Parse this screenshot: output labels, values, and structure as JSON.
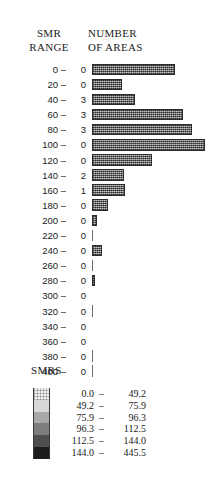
{
  "header": {
    "smr_range_line1": "SMR",
    "smr_range_line2": "RANGE",
    "number_areas_line1": "NUMBER",
    "number_areas_line2": "OF AREAS"
  },
  "chart_data": {
    "type": "bar",
    "orientation": "horizontal",
    "title": "",
    "xlabel": "NUMBER OF AREAS",
    "ylabel": "SMR RANGE",
    "grid": false,
    "legend_position": "bottom-left",
    "categories": [
      "0 –",
      "20 –",
      "40 –",
      "60 –",
      "80 –",
      "100 –",
      "120 –",
      "140 –",
      "160 –",
      "180 –",
      "200 –",
      "220 –",
      "240 –",
      "260 –",
      "280 –",
      "300 –",
      "320 –",
      "340 –",
      "360 –",
      "380 –",
      "400 –"
    ],
    "counts": [
      0,
      0,
      3,
      3,
      3,
      0,
      0,
      2,
      1,
      0,
      0,
      0,
      0,
      0,
      0,
      0,
      0,
      0,
      0,
      0,
      0
    ],
    "bar_lengths": [
      83,
      30,
      43,
      91,
      100,
      113,
      60,
      32,
      33,
      16,
      5,
      1,
      10,
      1,
      3,
      0,
      1,
      0,
      0,
      1,
      1
    ],
    "xlim": [
      0,
      116
    ]
  },
  "rows": [
    {
      "label": "0 –",
      "count": "0",
      "bar": 83
    },
    {
      "label": "20 –",
      "count": "0",
      "bar": 30
    },
    {
      "label": "40 –",
      "count": "3",
      "bar": 43
    },
    {
      "label": "60 –",
      "count": "3",
      "bar": 91
    },
    {
      "label": "80 –",
      "count": "3",
      "bar": 100
    },
    {
      "label": "100 –",
      "count": "0",
      "bar": 113
    },
    {
      "label": "120 –",
      "count": "0",
      "bar": 60
    },
    {
      "label": "140 –",
      "count": "2",
      "bar": 32
    },
    {
      "label": "160 –",
      "count": "1",
      "bar": 33
    },
    {
      "label": "180 –",
      "count": "0",
      "bar": 16
    },
    {
      "label": "200 –",
      "count": "0",
      "bar": 5
    },
    {
      "label": "220 –",
      "count": "0",
      "bar": 1
    },
    {
      "label": "240 –",
      "count": "0",
      "bar": 10
    },
    {
      "label": "260 –",
      "count": "0",
      "bar": 1
    },
    {
      "label": "280 –",
      "count": "0",
      "bar": 3
    },
    {
      "label": "300 –",
      "count": "0",
      "bar": 0
    },
    {
      "label": "320 –",
      "count": "0",
      "bar": 1
    },
    {
      "label": "340 –",
      "count": "0",
      "bar": 0
    },
    {
      "label": "360 –",
      "count": "0",
      "bar": 0
    },
    {
      "label": "380 –",
      "count": "0",
      "bar": 1
    },
    {
      "label": "400 –",
      "count": "0",
      "bar": 1
    }
  ],
  "legend": {
    "title": "SMRS",
    "classes": [
      {
        "low": "0.0",
        "dash": "–",
        "high": "49.2",
        "color": "#f2f2f2"
      },
      {
        "low": "49.2",
        "dash": "–",
        "high": "75.9",
        "color": "#d8d8d8"
      },
      {
        "low": "75.9",
        "dash": "–",
        "high": "96.3",
        "color": "#a8a8a8"
      },
      {
        "low": "96.3",
        "dash": "–",
        "high": "112.5",
        "color": "#7d7d7d"
      },
      {
        "low": "112.5",
        "dash": "–",
        "high": "144.0",
        "color": "#4e4e4e"
      },
      {
        "low": "144.0",
        "dash": "–",
        "high": "445.5",
        "color": "#1c1c1c"
      }
    ]
  }
}
